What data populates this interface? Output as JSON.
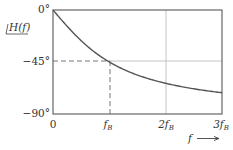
{
  "chart_data": {
    "type": "line",
    "title": "",
    "ylabel": "∠H(f)",
    "xlabel": "f",
    "xlabel_arrow": "→",
    "xlim": [
      0,
      3
    ],
    "ylim": [
      -90,
      0
    ],
    "x_ticks": [
      {
        "value": 0,
        "label": "0"
      },
      {
        "value": 1,
        "label": "f",
        "sub": "B"
      },
      {
        "value": 2,
        "label": "2f",
        "sub": "B"
      },
      {
        "value": 3,
        "label": "3f",
        "sub": "B"
      }
    ],
    "y_ticks": [
      {
        "value": 0,
        "label": "0°"
      },
      {
        "value": -45,
        "label": "−45°"
      },
      {
        "value": -90,
        "label": "−90°"
      }
    ],
    "grid": {
      "vertical": [
        1,
        2
      ],
      "horizontal": [
        -45
      ]
    },
    "annotations": [
      {
        "type": "dashed-guide",
        "x": 1,
        "y": -45,
        "description": "-45° at f = fB"
      }
    ],
    "series": [
      {
        "name": "phase of H(f) = -arctan(f/fB)",
        "x": [
          0,
          0.25,
          0.5,
          0.75,
          1.0,
          1.25,
          1.5,
          1.75,
          2.0,
          2.25,
          2.5,
          2.75,
          3.0
        ],
        "values": [
          0,
          -14.0,
          -26.6,
          -36.9,
          -45.0,
          -51.3,
          -56.3,
          -60.3,
          -63.4,
          -66.0,
          -68.2,
          -70.0,
          -71.6
        ]
      }
    ],
    "legend": "none",
    "colors": {
      "curve": "#555555",
      "frame": "#555555",
      "grid": "#bbbbbb",
      "dashed": "#666666"
    }
  },
  "labels": {
    "y0": "0°",
    "y45": "−45°",
    "y90": "−90°",
    "ylabel": "H(f)",
    "x0": "0",
    "x1": "f",
    "x2": "2f",
    "x3": "3f",
    "xsub": "B",
    "xlabel": "f"
  }
}
